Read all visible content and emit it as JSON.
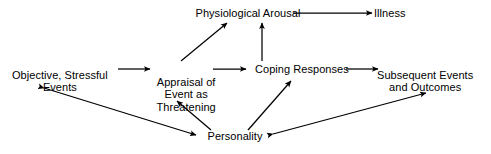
{
  "diagram": {
    "type": "flow-diagram",
    "background_color": "#ffffff",
    "stroke_color": "#000000",
    "text_color": "#000000",
    "nodes": [
      {
        "id": "physiological-arousal",
        "label": "Physiological Arousal",
        "lines": [
          "Physiological Arousal"
        ],
        "x": 248,
        "y": 13
      },
      {
        "id": "illness",
        "label": "Illness",
        "lines": [
          "Illness"
        ],
        "x": 390,
        "y": 13
      },
      {
        "id": "objective-stressful-events",
        "label": "Objective, Stressful Events",
        "lines": [
          "Objective, Stressful",
          "Events"
        ],
        "x": 60,
        "y": 75
      },
      {
        "id": "appraisal-of-event-as-threatening",
        "label": "Appraisal of Event as Threatening",
        "lines": [
          "Appraisal of",
          "Event as",
          "Threatening"
        ],
        "x": 186,
        "y": 82
      },
      {
        "id": "coping-responses",
        "label": "Coping Responses",
        "lines": [
          "Coping Responses"
        ],
        "x": 302,
        "y": 69
      },
      {
        "id": "subsequent-events-and-outcomes",
        "label": "Subsequent Events and Outcomes",
        "lines": [
          "Subsequent Events",
          "and Outcomes"
        ],
        "x": 425,
        "y": 75
      },
      {
        "id": "personality",
        "label": "Personality",
        "lines": [
          "Personality"
        ],
        "x": 235,
        "y": 136
      }
    ],
    "edges": [
      {
        "id": "arousal-to-illness",
        "from": "physiological-arousal",
        "to": "illness",
        "arrowheads": "end",
        "x1": 293,
        "y1": 13,
        "x2": 372,
        "y2": 13
      },
      {
        "id": "events-to-appraisal",
        "from": "objective-stressful-events",
        "to": "appraisal-of-event-as-threatening",
        "arrowheads": "end",
        "x1": 118,
        "y1": 69,
        "x2": 150,
        "y2": 69
      },
      {
        "id": "appraisal-to-coping",
        "from": "appraisal-of-event-as-threatening",
        "to": "coping-responses",
        "arrowheads": "end",
        "x1": 213,
        "y1": 69,
        "x2": 246,
        "y2": 69
      },
      {
        "id": "coping-to-subsequent",
        "from": "coping-responses",
        "to": "subsequent-events-and-outcomes",
        "arrowheads": "end",
        "x1": 346,
        "y1": 69,
        "x2": 378,
        "y2": 69
      },
      {
        "id": "appraisal-to-arousal",
        "from": "appraisal-of-event-as-threatening",
        "to": "physiological-arousal",
        "arrowheads": "end",
        "x1": 181,
        "y1": 61,
        "x2": 227,
        "y2": 23
      },
      {
        "id": "coping-to-arousal",
        "from": "coping-responses",
        "to": "physiological-arousal",
        "arrowheads": "end",
        "x1": 262,
        "y1": 61,
        "x2": 262,
        "y2": 23
      },
      {
        "id": "personality-to-appraisal",
        "from": "personality",
        "to": "appraisal-of-event-as-threatening",
        "arrowheads": "end",
        "x1": 211,
        "y1": 130,
        "x2": 177,
        "y2": 101
      },
      {
        "id": "personality-to-coping",
        "from": "personality",
        "to": "coping-responses",
        "arrowheads": "end",
        "x1": 248,
        "y1": 130,
        "x2": 291,
        "y2": 81
      },
      {
        "id": "events-personality-bidirectional",
        "from": "objective-stressful-events",
        "to": "personality",
        "arrowheads": "both",
        "x1": 44,
        "y1": 88,
        "x2": 196,
        "y2": 135
      },
      {
        "id": "personality-subsequent-bidirectional",
        "from": "personality",
        "to": "subsequent-events-and-outcomes",
        "arrowheads": "both",
        "x1": 273,
        "y1": 134,
        "x2": 426,
        "y2": 93
      }
    ]
  }
}
